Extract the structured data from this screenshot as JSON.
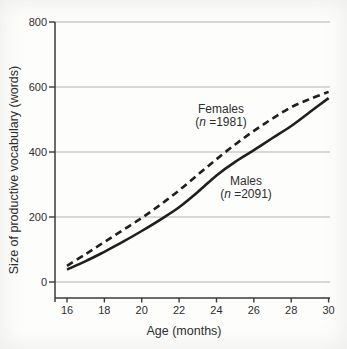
{
  "chart_data": {
    "type": "line",
    "title": "",
    "xlabel": "Age (months)",
    "ylabel": "Size of productive vocabulary (words)",
    "x": [
      16,
      17,
      18,
      19,
      20,
      21,
      22,
      23,
      24,
      25,
      26,
      27,
      28,
      29,
      30
    ],
    "xticks": [
      16,
      18,
      20,
      22,
      24,
      26,
      28,
      30
    ],
    "yticks": [
      0,
      200,
      400,
      600,
      800
    ],
    "xlim": [
      15.4,
      30.1
    ],
    "ylim": [
      -50,
      800
    ],
    "grid": "horizontal",
    "legend_position": "inline-annotations",
    "series": [
      {
        "name": "Females",
        "n_label": "(n =1981)",
        "style": "dashed",
        "values": [
          50,
          86,
          123,
          160,
          197,
          238,
          282,
          330,
          378,
          423,
          465,
          503,
          538,
          563,
          585
        ]
      },
      {
        "name": "Males",
        "n_label": "(n =2091)",
        "style": "solid",
        "values": [
          38,
          64,
          93,
          124,
          157,
          192,
          230,
          277,
          328,
          370,
          406,
          443,
          480,
          523,
          566
        ]
      }
    ],
    "colors": {
      "curve": "#1f1f1f",
      "grid": "#b3b3b3",
      "axis": "#3a3a3a",
      "text": "#2e2e2e",
      "background": "#fdfdfc"
    }
  }
}
